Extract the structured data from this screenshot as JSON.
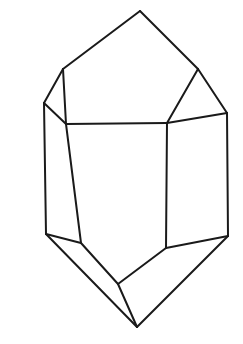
{
  "figure": {
    "style": "black ink outline on white background",
    "canvas": {
      "width": 243,
      "height": 344,
      "background": "#ffffff"
    },
    "stroke": {
      "color": "#1a1a1a",
      "width": 2
    }
  },
  "geometry": {
    "vertices": {
      "top_apex": [
        140,
        11
      ],
      "left_shoulder": [
        63,
        69
      ],
      "right_shoulder": [
        198,
        69
      ],
      "left_upper_bend": [
        44,
        103
      ],
      "right_upper_bend": [
        227,
        113
      ],
      "front_left_top": [
        66,
        124
      ],
      "front_right_top": [
        167,
        123
      ],
      "left_lower_corner": [
        46,
        234
      ],
      "front_left_bottom": [
        81,
        243
      ],
      "front_right_bottom": [
        166,
        248
      ],
      "right_lower_corner": [
        228,
        236
      ],
      "lower_middle_vertex": [
        118,
        284
      ],
      "bottom_apex": [
        137,
        327
      ]
    },
    "faces": [
      {
        "name": "upper-rhomb-face",
        "points": "140,11 198,69 167,123 66,124 63,69"
      },
      {
        "name": "upper-left-triangular-face",
        "points": "63,69 66,124 44,103"
      },
      {
        "name": "upper-right-triangular-face",
        "points": "198,69 227,113 167,123"
      },
      {
        "name": "front-prism-face",
        "points": "66,124 167,123 166,248 118,284 81,243"
      },
      {
        "name": "left-prism-face",
        "points": "44,103 66,124 81,243 46,234"
      },
      {
        "name": "right-prism-face",
        "points": "167,123 227,113 228,236 166,248"
      },
      {
        "name": "lower-left-face",
        "points": "46,234 81,243 118,284 137,327"
      },
      {
        "name": "lower-right-face",
        "points": "166,248 228,236 137,327 118,284"
      }
    ],
    "edges": [
      {
        "name": "edge-apex-to-left-shoulder",
        "d": "M 140,11 L 63,69"
      },
      {
        "name": "edge-apex-to-right-shoulder",
        "d": "M 140,11 L 198,69"
      },
      {
        "name": "edge-left-shoulder-to-left-bend",
        "d": "M 63,69 L 44,103"
      },
      {
        "name": "edge-left-shoulder-to-front-left-top",
        "d": "M 63,69 L 66,124"
      },
      {
        "name": "edge-right-shoulder-to-right-bend",
        "d": "M 198,69 L 227,113"
      },
      {
        "name": "edge-right-shoulder-to-front-right-top",
        "d": "M 198,69 L 167,123"
      },
      {
        "name": "edge-left-bend-to-front-left-top",
        "d": "M 44,103 L 66,124"
      },
      {
        "name": "edge-right-bend-to-front-right-top",
        "d": "M 227,113 L 167,123"
      },
      {
        "name": "edge-front-top-horizontal",
        "d": "M 66,124 L 167,123"
      },
      {
        "name": "edge-left-outer-vertical",
        "d": "M 44,103 L 46,234"
      },
      {
        "name": "edge-right-outer-vertical",
        "d": "M 227,113 L 228,236"
      },
      {
        "name": "edge-front-left-vertical",
        "d": "M 66,124 L 81,243"
      },
      {
        "name": "edge-front-right-vertical",
        "d": "M 167,123 L 166,248"
      },
      {
        "name": "edge-left-lower-to-front-left-bottom",
        "d": "M 46,234 L 81,243"
      },
      {
        "name": "edge-right-lower-to-front-right-bottom",
        "d": "M 228,236 L 166,248"
      },
      {
        "name": "edge-front-left-bottom-to-middle",
        "d": "M 81,243 L 118,284"
      },
      {
        "name": "edge-front-right-bottom-to-middle",
        "d": "M 166,248 L 118,284"
      },
      {
        "name": "edge-middle-to-bottom-apex",
        "d": "M 118,284 L 137,327"
      },
      {
        "name": "edge-left-lower-to-bottom-apex",
        "d": "M 46,234 L 137,327"
      },
      {
        "name": "edge-right-lower-to-bottom-apex",
        "d": "M 228,236 L 137,327"
      }
    ]
  }
}
